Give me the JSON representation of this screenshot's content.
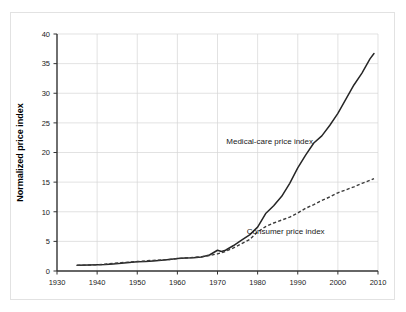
{
  "chart_data": {
    "type": "line",
    "title": "",
    "xlabel": "",
    "ylabel": "Normalized price index",
    "xlim": [
      1930,
      2010
    ],
    "ylim": [
      0,
      40
    ],
    "grid": true,
    "legend_position": "inline-annotation",
    "xticks": [
      "1930",
      "1940",
      "1950",
      "1960",
      "1970",
      "1980",
      "1990",
      "2000",
      "2010"
    ],
    "yticks": [
      "0",
      "5",
      "10",
      "15",
      "20",
      "25",
      "30",
      "35",
      "40"
    ],
    "xtick_values": [
      1930,
      1940,
      1950,
      1960,
      1970,
      1980,
      1990,
      2000,
      2010
    ],
    "ytick_values": [
      0,
      5,
      10,
      15,
      20,
      25,
      30,
      35,
      40
    ],
    "annotations": [
      {
        "name": "medical-care-annotation",
        "text": "Medical-care price index",
        "x": 1983,
        "y": 21.5
      },
      {
        "name": "consumer-annotation",
        "text": "Consumer price index",
        "x": 1987,
        "y": 6.2
      }
    ],
    "series": [
      {
        "name": "Medical-care price index",
        "style": "solid",
        "color": "#262626",
        "x": [
          1935,
          1938,
          1940,
          1942,
          1944,
          1946,
          1948,
          1950,
          1952,
          1954,
          1956,
          1958,
          1960,
          1962,
          1964,
          1966,
          1968,
          1970,
          1971,
          1972,
          1974,
          1976,
          1978,
          1980,
          1982,
          1984,
          1986,
          1988,
          1990,
          1992,
          1994,
          1996,
          1998,
          2000,
          2002,
          2004,
          2006,
          2008,
          2009
        ],
        "y": [
          0.95,
          1.0,
          1.05,
          1.1,
          1.2,
          1.3,
          1.45,
          1.55,
          1.6,
          1.7,
          1.8,
          1.95,
          2.1,
          2.2,
          2.25,
          2.35,
          2.7,
          3.5,
          3.3,
          3.5,
          4.3,
          5.2,
          6.1,
          7.4,
          9.7,
          11.0,
          12.6,
          14.8,
          17.4,
          19.6,
          21.6,
          22.8,
          24.6,
          26.6,
          29.0,
          31.4,
          33.4,
          35.8,
          36.7
        ]
      },
      {
        "name": "Consumer price index",
        "style": "dashed",
        "color": "#3a3a3a",
        "x": [
          1935,
          1938,
          1940,
          1942,
          1944,
          1946,
          1948,
          1950,
          1952,
          1954,
          1956,
          1958,
          1960,
          1962,
          1964,
          1966,
          1968,
          1970,
          1972,
          1974,
          1976,
          1978,
          1980,
          1982,
          1984,
          1986,
          1988,
          1990,
          1992,
          1994,
          1996,
          1998,
          2000,
          2002,
          2004,
          2006,
          2008,
          2009
        ],
        "y": [
          0.95,
          1.0,
          1.05,
          1.15,
          1.3,
          1.4,
          1.5,
          1.6,
          1.7,
          1.8,
          1.85,
          1.95,
          2.1,
          2.2,
          2.3,
          2.4,
          2.6,
          2.9,
          3.3,
          3.9,
          4.6,
          5.3,
          6.6,
          7.5,
          8.1,
          8.6,
          9.1,
          9.8,
          10.6,
          11.2,
          11.9,
          12.5,
          13.2,
          13.7,
          14.2,
          14.8,
          15.3,
          15.6
        ]
      }
    ]
  },
  "layout": {
    "plot_left": 57,
    "plot_right": 378,
    "plot_top": 34,
    "plot_bottom": 271
  }
}
